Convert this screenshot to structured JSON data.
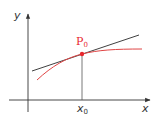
{
  "diagram": {
    "axes": {
      "x_label": "x",
      "y_label": "y"
    },
    "point": {
      "label": "P",
      "label_sub": "0",
      "color": "#e8262d"
    },
    "x_marker": {
      "label": "x",
      "label_sub": "0"
    },
    "colors": {
      "axis": "#333333",
      "tangent": "#2a2a2a",
      "curve": "#e04545",
      "point": "#e8262d",
      "drop_line": "#555555"
    }
  }
}
